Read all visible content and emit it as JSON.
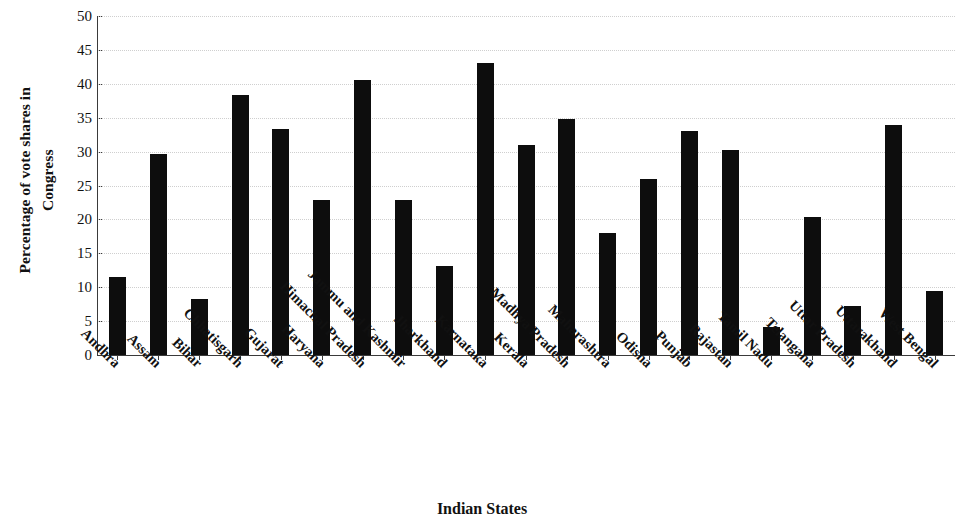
{
  "chart_data": {
    "type": "bar",
    "title": "",
    "xlabel": "Indian States",
    "ylabel": "Percentage of vote shares in Congress",
    "ylabel_lines": [
      "Percentage of vote shares in",
      "Congress"
    ],
    "ylim": [
      0,
      50
    ],
    "ytick_values": [
      0,
      5,
      10,
      15,
      20,
      25,
      30,
      35,
      40,
      45,
      50
    ],
    "ytick_labels": [
      "0",
      "5",
      "10",
      "15",
      "20",
      "25",
      "30",
      "35",
      "40",
      "45",
      "50"
    ],
    "grid": true,
    "legend": "none",
    "bar_color": "#0d0d0d",
    "grid_color": "#cfcfcf",
    "axis_color": "#3a3a3a",
    "categories": [
      "Andhra",
      "Assam",
      "Bihar",
      "Chhatisgarh",
      "Gujarat",
      "Haryana",
      "Himachal Pradesh",
      "Jammu and Kashmir",
      "Jharkhand",
      "Karnataka",
      "Kerala",
      "Madhya Pradesh",
      "Maharashtra",
      "Odisha",
      "Punjab",
      "Rajastan",
      "Tamil Nadu",
      "Telangana",
      "Uttar Pradesh",
      "Uttarakhand",
      "West Bengal"
    ],
    "values": [
      11.5,
      29.7,
      8.2,
      38.3,
      33.4,
      22.8,
      40.6,
      22.8,
      13.2,
      43.0,
      31.0,
      34.8,
      18.0,
      25.9,
      33.0,
      30.2,
      4.2,
      20.3,
      7.3,
      33.9,
      9.5
    ]
  }
}
